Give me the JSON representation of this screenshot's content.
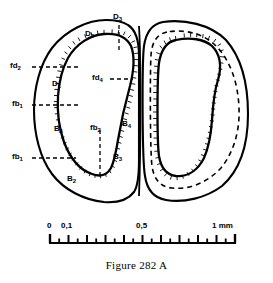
{
  "figure": {
    "caption": "Figure 282 A",
    "background_color": "#ffffff",
    "ink_color": "#000000",
    "specimen": "ostracod carapace valves, interior view",
    "valves": [
      {
        "name": "left-valve",
        "features": "outer margin, crenulate inner lamella, hinge"
      },
      {
        "name": "right-valve",
        "features": "outer margin, dashed intermediate line, crenulate inner lamella"
      }
    ]
  },
  "labels": {
    "left_leader": [
      {
        "id": "fd2",
        "text": "fd",
        "sub": "2"
      },
      {
        "id": "fb1_upper",
        "text": "fb",
        "sub": "1"
      },
      {
        "id": "fb1_lower",
        "text": "fb",
        "sub": "1"
      }
    ],
    "interior": [
      {
        "id": "D3",
        "text": "D",
        "sub": "3"
      },
      {
        "id": "D2",
        "text": "D",
        "sub": "2"
      },
      {
        "id": "D1",
        "text": "D",
        "sub": "1"
      },
      {
        "id": "fd4",
        "text": "fd",
        "sub": "4"
      },
      {
        "id": "fb2",
        "text": "fb",
        "sub": "2"
      },
      {
        "id": "B1",
        "text": "B",
        "sub": "1"
      },
      {
        "id": "B2",
        "text": "B",
        "sub": "2"
      },
      {
        "id": "B3",
        "text": "B",
        "sub": "3"
      },
      {
        "id": "B4",
        "text": "B",
        "sub": "4"
      }
    ]
  },
  "scale_bar": {
    "unit": "mm",
    "min": 0,
    "max": 1,
    "major_interval": 0.1,
    "minor_interval": 0.05,
    "tick_labels": [
      {
        "value": "0",
        "at": 0
      },
      {
        "value": "0,1",
        "at": 0.1
      },
      {
        "value": "0,5",
        "at": 0.5
      },
      {
        "value": "1  mm",
        "at": 1
      }
    ]
  }
}
